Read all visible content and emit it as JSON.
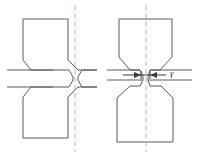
{
  "figure": {
    "background_color": "#ffffff",
    "outline_color": "#5a5a5a",
    "centerline_color": "#d8a3ab",
    "dimension_color": "#3a3a3a",
    "width": 199,
    "height": 157
  },
  "panels": [
    {
      "id": "left-panel",
      "name": "undeformed-specimen",
      "centerline_x": 75,
      "has_dimension": false
    },
    {
      "id": "right-panel",
      "name": "deformed-specimen",
      "centerline_x": 146,
      "has_dimension": true
    }
  ],
  "annotations": {
    "gamma_label": "γ",
    "gamma_label_x": 172,
    "gamma_label_y": 78
  },
  "icons": {
    "centerline": "axis-centerline",
    "arrow_left": "arrow-left-icon",
    "arrow_right": "arrow-right-icon"
  }
}
